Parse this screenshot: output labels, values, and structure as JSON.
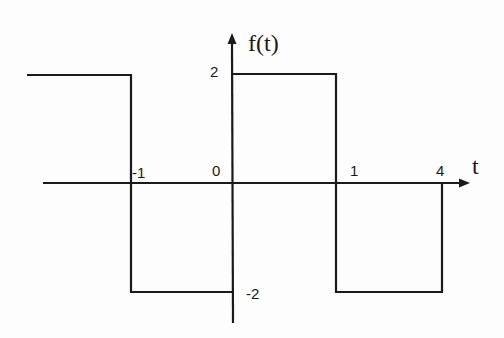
{
  "diagram": {
    "type": "piecewise-signal",
    "function_label": "f(t)",
    "x_axis_label": "t",
    "tick_labels": {
      "t_minus_1": "-1",
      "t_0": "0",
      "t_1": "1",
      "t_4": "4",
      "y_2": "2",
      "y_minus_2": "-2"
    },
    "segments": [
      {
        "from_t": "-inf",
        "to_t": -1,
        "value": 2
      },
      {
        "from_t": -1,
        "to_t": 0,
        "value": -2
      },
      {
        "from_t": 0,
        "to_t": 1,
        "value": 2
      },
      {
        "from_t": 1,
        "to_t": 4,
        "value": -2
      }
    ],
    "line_color": "#1a1a1a"
  }
}
